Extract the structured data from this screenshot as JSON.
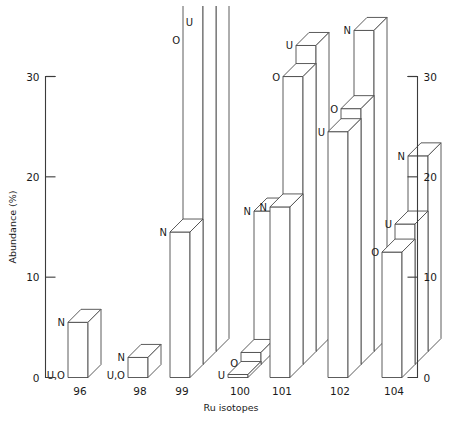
{
  "chart_data": {
    "type": "bar",
    "title": "",
    "subtitle": "",
    "xlabel": "Ru isotopes",
    "ylabel": "Abundance (%)",
    "ylim": [
      0,
      30
    ],
    "yticks": [
      0,
      10,
      20,
      30
    ],
    "ytick_labels": [
      "0",
      "10",
      "20",
      "30"
    ],
    "right_axis": true,
    "right_ytick_labels": [
      "0",
      "10",
      "20",
      "30"
    ],
    "grid": false,
    "legend_position": "inline-labels",
    "style": "3d-isometric-outline",
    "categories": [
      "96",
      "98",
      "99",
      "100",
      "101",
      "102",
      "104"
    ],
    "series": [
      {
        "name": "N",
        "label": "N",
        "values": [
          5.5,
          2.0,
          14.5,
          14.0,
          17.0,
          32.0,
          19.5
        ]
      },
      {
        "name": "O",
        "label": "O",
        "values": [
          0.0,
          0.0,
          41.0,
          1.2,
          28.7,
          25.5,
          12.5
        ]
      },
      {
        "name": "U",
        "label": "U",
        "values": [
          0.0,
          0.0,
          42.5,
          0.3,
          30.5,
          24.5,
          14.0
        ]
      }
    ],
    "bar_labels": [
      {
        "category": "96",
        "labels": [
          {
            "text": "U,O",
            "series": "U,O"
          },
          {
            "text": "N",
            "series": "N"
          }
        ]
      },
      {
        "category": "98",
        "labels": [
          {
            "text": "U,O",
            "series": "U,O"
          },
          {
            "text": "N",
            "series": "N"
          }
        ]
      },
      {
        "category": "99",
        "labels": [
          {
            "text": "N",
            "series": "N"
          },
          {
            "text": "O",
            "series": "O"
          },
          {
            "text": "U",
            "series": "U"
          }
        ]
      },
      {
        "category": "100",
        "labels": [
          {
            "text": "U",
            "series": "U"
          },
          {
            "text": "O",
            "series": "O"
          },
          {
            "text": "N",
            "series": "N"
          }
        ]
      },
      {
        "category": "101",
        "labels": [
          {
            "text": "N",
            "series": "N"
          },
          {
            "text": "O",
            "series": "O"
          },
          {
            "text": "U",
            "series": "U"
          }
        ]
      },
      {
        "category": "102",
        "labels": [
          {
            "text": "U",
            "series": "U"
          },
          {
            "text": "O",
            "series": "O"
          },
          {
            "text": "N",
            "series": "N"
          }
        ]
      },
      {
        "category": "104",
        "labels": [
          {
            "text": "O",
            "series": "O"
          },
          {
            "text": "U",
            "series": "U"
          },
          {
            "text": "N",
            "series": "N"
          }
        ]
      }
    ]
  },
  "axis": {
    "left": {
      "title": "Abundance (%)",
      "ticks": [
        "30",
        "20",
        "10",
        "0"
      ]
    },
    "right": {
      "ticks": [
        "30",
        "20",
        "10",
        "0"
      ]
    },
    "bottom": {
      "title": "Ru isotopes",
      "categories": [
        "96",
        "98",
        "99",
        "100",
        "101",
        "102",
        "104"
      ]
    }
  },
  "colors": {
    "background": "#ffffff",
    "axis": "#3b3b3b",
    "bar_outline": "#4a4a4a",
    "bar_fill": "#ffffff",
    "text": "#1a1a1a"
  }
}
